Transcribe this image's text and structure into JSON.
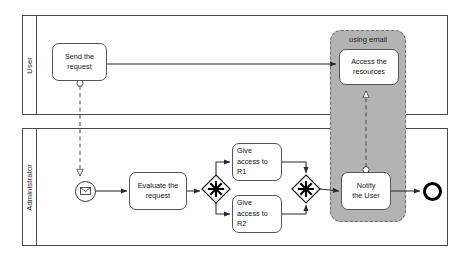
{
  "diagram": {
    "type": "bpmn-collaboration"
  },
  "pools": [
    {
      "id": "user",
      "label": "User",
      "x": 22,
      "y": 15,
      "w": 426,
      "h": 100,
      "header_w": 14
    },
    {
      "id": "administrator",
      "label": "Administrator",
      "x": 22,
      "y": 128,
      "w": 426,
      "h": 118,
      "header_w": 14
    }
  ],
  "groups": [
    {
      "id": "using-email",
      "label": "using email",
      "x": 330,
      "y": 30,
      "w": 76,
      "h": 192,
      "fill": "#b3b3b3",
      "stroke": "#6e6e6e"
    }
  ],
  "tasks": [
    {
      "id": "send-the-request",
      "label": "Send the\nrequest",
      "x": 52,
      "y": 43,
      "w": 55,
      "h": 38,
      "align": "center"
    },
    {
      "id": "access-the-resources",
      "label": "Access the\nresources",
      "x": 339,
      "y": 49,
      "w": 60,
      "h": 36,
      "align": "center"
    },
    {
      "id": "evaluate-the-request",
      "label": "Evaluate the\nrequest",
      "x": 129,
      "y": 172,
      "w": 58,
      "h": 38,
      "align": "center"
    },
    {
      "id": "give-access-to-r1",
      "label": "Give\naccess to\nR1",
      "x": 232,
      "y": 143,
      "w": 50,
      "h": 38,
      "align": "left"
    },
    {
      "id": "give-access-to-r2",
      "label": "Give\naccess to\nR2",
      "x": 232,
      "y": 195,
      "w": 50,
      "h": 38,
      "align": "left"
    },
    {
      "id": "notify-the-user",
      "label": "Notify\nthe User",
      "x": 341,
      "y": 172,
      "w": 50,
      "h": 38,
      "align": "center"
    }
  ],
  "events": [
    {
      "id": "message-start-event",
      "kind": "start",
      "marker": "envelope-icon",
      "cx": 85,
      "cy": 191,
      "r": 10.5
    },
    {
      "id": "end-event",
      "kind": "end",
      "marker": "none",
      "cx": 432,
      "cy": 191,
      "r": 9.5
    }
  ],
  "gateways": [
    {
      "id": "complex-gateway-split",
      "kind": "complex",
      "marker": "asterisk",
      "cx": 216,
      "cy": 189,
      "half": 14
    },
    {
      "id": "complex-gateway-join",
      "kind": "complex",
      "marker": "asterisk",
      "cx": 306,
      "cy": 189,
      "half": 14
    }
  ],
  "flows": {
    "sequence": [
      {
        "id": "start-to-evaluate",
        "from": "message-start-event",
        "to": "evaluate-the-request"
      },
      {
        "id": "evaluate-to-split",
        "from": "evaluate-the-request",
        "to": "complex-gateway-split"
      },
      {
        "id": "split-to-r1",
        "from": "complex-gateway-split",
        "to": "give-access-to-r1"
      },
      {
        "id": "split-to-r2",
        "from": "complex-gateway-split",
        "to": "give-access-to-r2"
      },
      {
        "id": "r1-to-join",
        "from": "give-access-to-r1",
        "to": "complex-gateway-join"
      },
      {
        "id": "r2-to-join",
        "from": "give-access-to-r2",
        "to": "complex-gateway-join"
      },
      {
        "id": "join-to-notify",
        "from": "complex-gateway-join",
        "to": "notify-the-user"
      },
      {
        "id": "notify-to-end",
        "from": "notify-the-user",
        "to": "end-event"
      }
    ],
    "message": [
      {
        "id": "send-request-to-start-event",
        "from": "send-the-request",
        "to": "message-start-event"
      },
      {
        "id": "send-request-to-access-resources",
        "from": "send-the-request",
        "to": "access-the-resources"
      },
      {
        "id": "notify-user-to-access-resources",
        "from": "notify-the-user",
        "to": "access-the-resources"
      }
    ]
  },
  "colors": {
    "stroke": "#4a4a4a",
    "task_stroke": "#555555",
    "group_fill": "#b3b3b3",
    "group_stroke": "#6e6e6e",
    "end_event_stroke": "#000000",
    "background": "#ffffff"
  }
}
